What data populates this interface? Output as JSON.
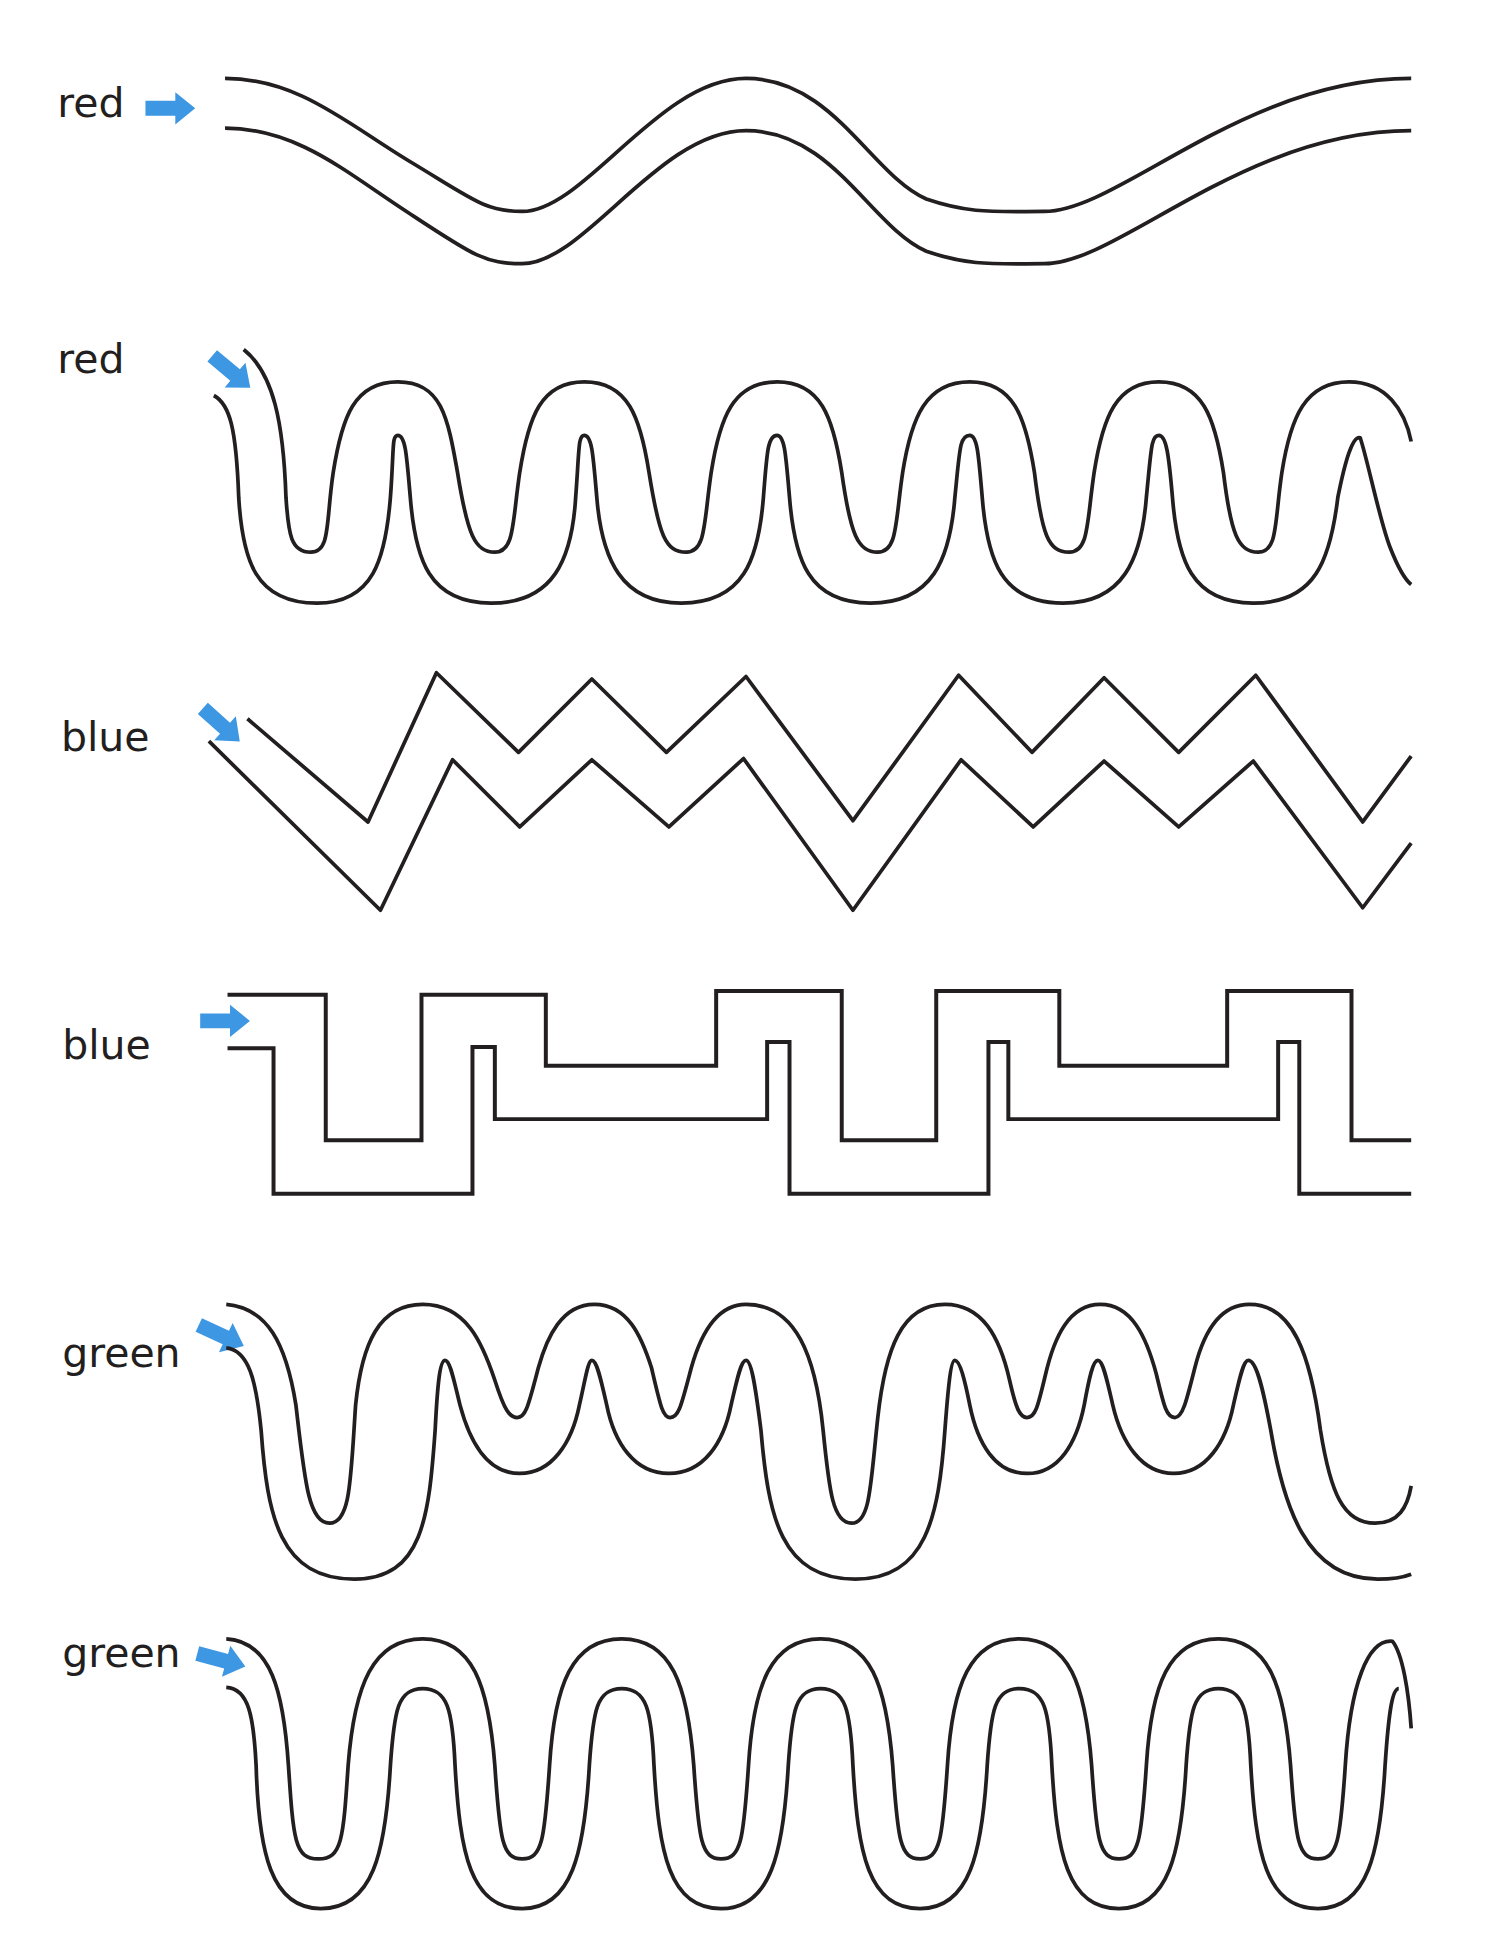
{
  "worksheet": {
    "arrow_color": "#3d97e3",
    "line_color": "#231f20",
    "mazes": [
      {
        "id": "maze-1",
        "label": "red",
        "label_pos": [
          46,
          94
        ],
        "shape": "gentle-wave",
        "arrow": {
          "x": 137,
          "y": 87,
          "angle": 0
        },
        "walls": [
          "M181,63 C240,63 280,100 330,130 C380,160 390,170 420,170 C470,170 530,63 600,63 C670,63 700,140 745,160 C780,172 800,170 840,170 C900,170 1000,63 1135,63",
          "M181,103 C240,103 280,140 330,172 C380,205 390,212 420,212 C470,212 530,105 600,105 C670,105 700,182 745,202 C780,214 800,212 840,212 C900,212 1000,105 1135,105"
        ]
      },
      {
        "id": "maze-2",
        "label": "red",
        "label_pos": [
          46,
          300
        ],
        "shape": "tight-wave",
        "arrow": {
          "x": 186,
          "y": 299,
          "angle": 40
        },
        "walls": [
          "M196,281 C220,300 228,340 230,400 C232,430 234,444 250,444 C266,444 262,420 268,380 C275,335 285,307 320,307 C355,307 360,335 368,380 C376,430 382,444 398,444 C414,444 412,420 418,380 C425,335 435,307 470,307 C505,307 515,335 522,380 C530,430 535,444 552,444 C568,444 566,420 572,380 C579,335 590,307 625,307 C660,307 670,335 677,380 C684,430 690,444 706,444 C722,444 720,420 726,380 C733,335 745,307 780,307 C815,307 825,335 832,380 C838,430 843,444 860,444 C876,444 874,420 880,380 C887,335 898,307 932,307 C967,307 977,335 984,380 C990,430 996,444 1012,444 C1028,444 1025,420 1031,380 C1038,335 1050,307 1085,307 C1115,307 1130,330 1135,355",
          "M172,318 C185,325 190,345 192,400 C195,450 205,485 255,485 C300,485 310,450 314,400 C317,360 315,350 320,350 C326,350 327,365 330,400 C334,450 345,485 395,485 C445,485 460,450 463,400 C466,360 465,350 470,350 C476,350 477,365 480,400 C484,450 500,485 548,485 C598,485 610,450 614,400 C617,360 618,350 625,350 C631,350 632,365 635,400 C639,450 650,485 700,485 C750,485 764,450 768,400 C772,360 772,350 780,350 C786,350 787,365 790,400 C794,450 805,485 855,485 C903,485 918,450 922,400 C926,360 926,350 932,350 C938,350 940,365 943,400 C947,450 958,485 1008,485 C1058,485 1070,450 1076,400 C1082,370 1088,350 1094,352 C1100,370 1110,420 1118,440 C1125,458 1130,466 1135,470"
        ]
      },
      {
        "id": "maze-3",
        "label": "blue",
        "label_pos": [
          49,
          604
        ],
        "shape": "zigzag",
        "arrow": {
          "x": 178,
          "y": 583,
          "angle": 42
        },
        "walls": [
          "M199,578 L296,661 L351,541 L417,605 L476,546 L536,605 L600,544 L686,660 L771,543 L830,605 L888,545 L948,605 L1010,543 L1096,661 L1135,608",
          "M168,596 L306,732 L364,611 L418,665 L476,611 L538,665 L598,610 L686,732 L773,611 L831,665 L888,612 L948,665 L1008,612 L1096,730 L1135,678"
        ]
      },
      {
        "id": "maze-4",
        "label": "blue",
        "label_pos": [
          50,
          852
        ],
        "shape": "square-wave",
        "arrow": {
          "x": 181,
          "y": 821,
          "angle": 0
        },
        "walls": [
          "M183,800 L262,800 L262,917 L339,917 L339,800 L439,800 L439,857 L576,857 L576,797 L677,797 L677,917 L753,917 L753,797 L852,797 L852,857 L987,857 L987,797 L1087,797 L1087,917 L1135,917",
          "M183,843 L220,843 L220,960 L380,960 L380,842 L398,842 L398,900 L617,900 L617,838 L635,838 L635,960 L795,960 L795,838 L811,838 L811,900 L1028,900 L1028,838 L1045,838 L1045,960 L1135,960"
        ]
      },
      {
        "id": "maze-5",
        "label": "green",
        "label_pos": [
          50,
          1099
        ],
        "shape": "irregular-wave",
        "arrow": {
          "x": 178,
          "y": 1074,
          "angle": 25
        },
        "walls": [
          "M182,1049 C215,1052 230,1080 238,1130 C245,1190 248,1225 265,1225 C282,1225 282,1190 286,1130 C291,1080 305,1049 340,1049 C375,1049 388,1080 398,1110 C406,1135 410,1140 416,1140 C423,1140 425,1130 433,1100 C440,1075 452,1049 478,1049 C505,1049 516,1075 524,1100 C531,1130 533,1140 539,1140 C546,1140 548,1130 556,1100 C563,1075 575,1049 600,1049 C640,1049 656,1090 662,1150 C667,1200 670,1225 685,1225 C700,1225 700,1195 706,1140 C712,1085 725,1049 760,1049 C790,1049 804,1075 812,1110 C817,1132 820,1140 826,1140 C833,1140 835,1130 841,1105 C848,1075 860,1049 885,1049 C910,1049 922,1075 930,1105 C936,1130 938,1140 945,1140 C951,1140 954,1128 961,1100 C968,1072 981,1049 1005,1049 C1040,1049 1054,1090 1062,1150 C1070,1200 1080,1225 1106,1225 C1125,1225 1132,1212 1135,1195",
          "M182,1084 C200,1086 206,1110 210,1150 C215,1220 225,1270 285,1270 C340,1270 345,1220 350,1150 C352,1110 354,1094 358,1094 C362,1094 365,1110 370,1130 C378,1160 392,1185 418,1185 C444,1185 460,1160 466,1130 C471,1108 473,1094 476,1094 C480,1094 483,1108 488,1130 C494,1160 510,1185 538,1185 C566,1185 582,1160 588,1130 C593,1108 596,1094 600,1094 C604,1094 607,1110 612,1150 C618,1220 628,1270 688,1270 C745,1270 755,1220 760,1150 C763,1110 765,1094 768,1094 C772,1094 776,1110 780,1130 C786,1160 800,1185 826,1185 C852,1185 866,1160 872,1130 C876,1108 879,1094 883,1094 C887,1094 890,1108 895,1130 C902,1160 918,1185 944,1185 C970,1185 986,1160 992,1130 C997,1108 1000,1094 1004,1094 C1010,1094 1015,1112 1022,1150 C1032,1210 1050,1270 1108,1270 C1120,1270 1130,1268 1135,1266"
        ]
      },
      {
        "id": "maze-6",
        "label": "green",
        "label_pos": [
          50,
          1341
        ],
        "shape": "regular-wave",
        "arrow": {
          "x": 178,
          "y": 1335,
          "angle": 15
        },
        "walls": [
          "M182,1318 C218,1320 228,1360 232,1420 C236,1480 237,1495 256,1495 C275,1495 276,1480 280,1420 C285,1355 300,1318 340,1318 C380,1318 393,1355 398,1420 C402,1480 404,1495 420,1495 C436,1495 438,1480 442,1420 C446,1355 460,1318 500,1318 C540,1318 553,1355 558,1420 C562,1480 564,1495 580,1495 C596,1495 598,1480 602,1420 C606,1355 620,1318 660,1318 C700,1318 713,1355 718,1420 C722,1480 724,1495 740,1495 C756,1495 758,1480 762,1420 C766,1355 780,1318 820,1318 C860,1318 873,1355 878,1420 C882,1480 884,1495 900,1495 C916,1495 918,1480 922,1420 C926,1355 940,1318 980,1318 C1020,1318 1033,1355 1038,1420 C1042,1480 1044,1495 1060,1495 C1076,1495 1078,1480 1082,1420 C1086,1355 1100,1318 1120,1320 C1128,1330 1133,1360 1135,1390",
          "M182,1357 C200,1358 204,1380 206,1420 C208,1490 218,1535 258,1535 C300,1535 310,1490 314,1420 C317,1375 320,1358 340,1358 C360,1358 364,1375 366,1420 C370,1490 378,1535 420,1535 C460,1535 470,1490 474,1420 C477,1375 480,1358 500,1358 C520,1358 524,1375 526,1420 C530,1490 538,1535 580,1535 C620,1535 630,1490 634,1420 C637,1375 640,1358 660,1358 C680,1358 684,1375 686,1420 C690,1490 698,1535 740,1535 C780,1535 790,1490 794,1420 C797,1375 800,1358 820,1358 C840,1358 844,1375 846,1420 C850,1490 858,1535 900,1535 C940,1535 950,1490 954,1420 C957,1375 960,1358 980,1358 C1000,1358 1004,1375 1006,1420 C1010,1490 1018,1535 1060,1535 C1100,1535 1110,1490 1114,1420 C1117,1375 1120,1358 1125,1358"
        ]
      }
    ]
  }
}
